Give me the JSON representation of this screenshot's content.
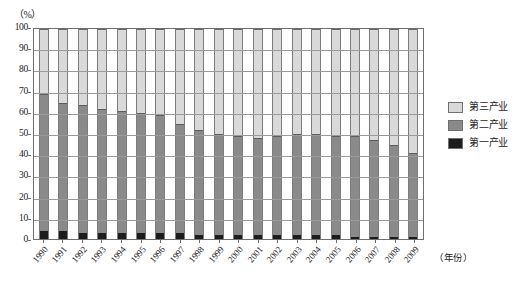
{
  "chart_data": {
    "type": "bar",
    "subtype": "100% stacked bar",
    "title": "",
    "xlabel": "（年份）",
    "ylabel": "（%）",
    "ylim": [
      0,
      100
    ],
    "ytick_step": 10,
    "grid": true,
    "legend_position": "right",
    "categories": [
      "1990",
      "1991",
      "1992",
      "1993",
      "1994",
      "1995",
      "1996",
      "1997",
      "1998",
      "1999",
      "2000",
      "2001",
      "2002",
      "2003",
      "2004",
      "2005",
      "2006",
      "2007",
      "2008",
      "2009"
    ],
    "yticks": [
      "0",
      "10",
      "20",
      "30",
      "40",
      "50",
      "60",
      "70",
      "80",
      "90",
      "100"
    ],
    "series": [
      {
        "name": "第一产业",
        "color": "#1c1c1c",
        "values": [
          4,
          4,
          3,
          3,
          3,
          3,
          3,
          3,
          2,
          2,
          2,
          2,
          2,
          2,
          2,
          2,
          1,
          1,
          1,
          1
        ]
      },
      {
        "name": "第二产业",
        "color": "#8a8a8a",
        "values": [
          65,
          61,
          61,
          59,
          58,
          57,
          56,
          52,
          50,
          48,
          47,
          46,
          47,
          48,
          48,
          47,
          48,
          46,
          44,
          40
        ]
      },
      {
        "name": "第三产业",
        "color": "#d9d9d9",
        "values": [
          31,
          35,
          36,
          38,
          39,
          40,
          41,
          45,
          48,
          50,
          51,
          52,
          51,
          50,
          50,
          51,
          51,
          53,
          55,
          59
        ]
      }
    ]
  },
  "legend": {
    "items": [
      {
        "label": "第三产业",
        "color": "#d9d9d9"
      },
      {
        "label": "第二产业",
        "color": "#8a8a8a"
      },
      {
        "label": "第一产业",
        "color": "#1c1c1c"
      }
    ]
  }
}
